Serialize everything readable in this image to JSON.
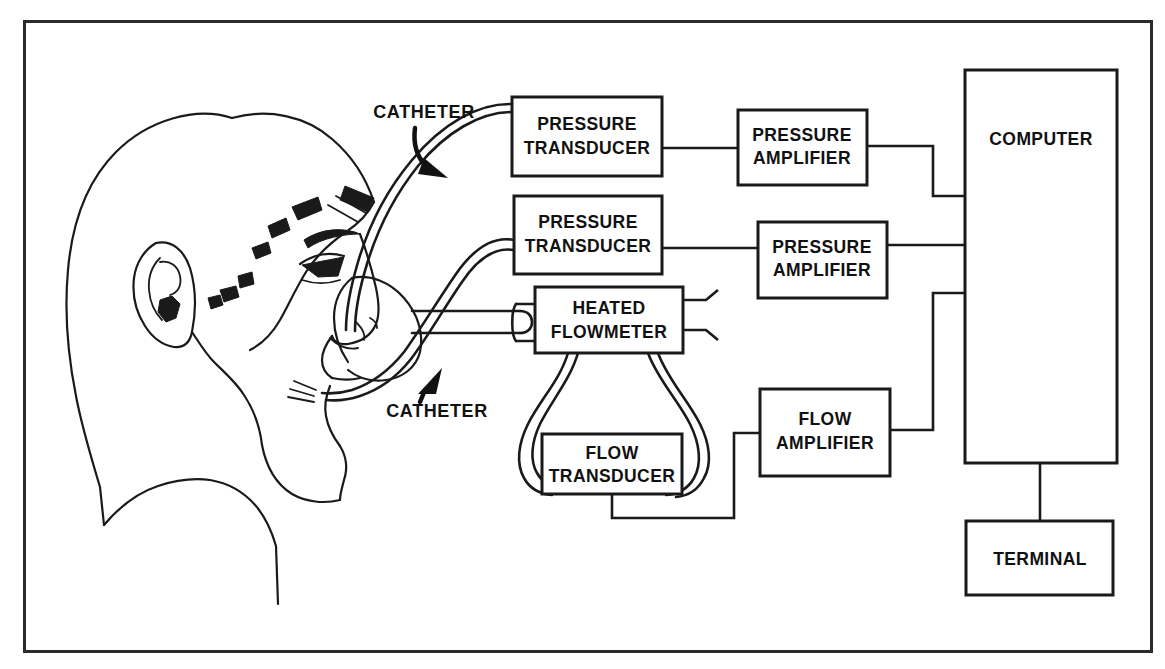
{
  "figure": {
    "background_color": "#ffffff",
    "line_color": "#1a1a1a",
    "frame_color": "#2b2b2b",
    "width": 1165,
    "height": 669
  },
  "subject": {
    "name": "patient-head-profile",
    "description": "Line drawing of a child's head in left profile wearing a nasal mask with mouthpiece tube"
  },
  "callouts": [
    {
      "id": "catheter-upper",
      "label": "CATHETER",
      "x": 424,
      "y": 118
    },
    {
      "id": "catheter-lower",
      "label": "CATHETER",
      "x": 437,
      "y": 417
    }
  ],
  "blocks": [
    {
      "id": "pressure-transducer-1",
      "line1": "PRESSURE",
      "line2": "TRANSDUCER",
      "x": 512,
      "y": 97,
      "w": 150,
      "h": 79
    },
    {
      "id": "pressure-transducer-2",
      "line1": "PRESSURE",
      "line2": "TRANSDUCER",
      "x": 514,
      "y": 196,
      "w": 148,
      "h": 78
    },
    {
      "id": "heated-flowmeter",
      "line1": "HEATED",
      "line2": "FLOWMETER",
      "x": 535,
      "y": 287,
      "w": 148,
      "h": 66
    },
    {
      "id": "flow-transducer",
      "line1": "FLOW",
      "line2": "TRANSDUCER",
      "x": 542,
      "y": 434,
      "w": 140,
      "h": 60
    },
    {
      "id": "pressure-amplifier-1",
      "line1": "PRESSURE",
      "line2": "AMPLIFIER",
      "x": 738,
      "y": 110,
      "w": 129,
      "h": 75
    },
    {
      "id": "pressure-amplifier-2",
      "line1": "PRESSURE",
      "line2": "AMPLIFIER",
      "x": 758,
      "y": 222,
      "w": 129,
      "h": 76
    },
    {
      "id": "flow-amplifier",
      "line1": "FLOW",
      "line2": "AMPLIFIER",
      "x": 760,
      "y": 389,
      "w": 130,
      "h": 87
    },
    {
      "id": "computer",
      "line1": "COMPUTER",
      "line2": "",
      "x": 965,
      "y": 70,
      "w": 152,
      "h": 393
    },
    {
      "id": "terminal",
      "line1": "TERMINAL",
      "line2": "",
      "x": 966,
      "y": 521,
      "w": 147,
      "h": 74
    }
  ],
  "connections": [
    {
      "id": "catheter-to-pressure-transducer-1",
      "from": "patient-nose",
      "to": "pressure-transducer-1",
      "kind": "catheter-tube"
    },
    {
      "id": "catheter-to-pressure-transducer-2",
      "from": "patient-mouth",
      "to": "pressure-transducer-2",
      "kind": "catheter-tube"
    },
    {
      "id": "pressure-transducer-1-to-pressure-amplifier-1",
      "from": "pressure-transducer-1",
      "to": "pressure-amplifier-1",
      "kind": "wire"
    },
    {
      "id": "pressure-transducer-2-to-pressure-amplifier-2",
      "from": "pressure-transducer-2",
      "to": "pressure-amplifier-2",
      "kind": "wire"
    },
    {
      "id": "pressure-amplifier-1-to-computer",
      "from": "pressure-amplifier-1",
      "to": "computer",
      "kind": "wire"
    },
    {
      "id": "pressure-amplifier-2-to-computer",
      "from": "pressure-amplifier-2",
      "to": "computer",
      "kind": "wire"
    },
    {
      "id": "mouthpiece-to-heated-flowmeter",
      "from": "patient-mouthpiece",
      "to": "heated-flowmeter",
      "kind": "airway-tube"
    },
    {
      "id": "heated-flowmeter-to-flow-transducer-left",
      "from": "heated-flowmeter",
      "to": "flow-transducer",
      "kind": "pressure-tube"
    },
    {
      "id": "heated-flowmeter-to-flow-transducer-right",
      "from": "heated-flowmeter",
      "to": "flow-transducer",
      "kind": "pressure-tube"
    },
    {
      "id": "flow-transducer-to-flow-amplifier",
      "from": "flow-transducer",
      "to": "flow-amplifier",
      "kind": "wire"
    },
    {
      "id": "flow-amplifier-to-computer",
      "from": "flow-amplifier",
      "to": "computer",
      "kind": "wire"
    },
    {
      "id": "computer-to-terminal",
      "from": "computer",
      "to": "terminal",
      "kind": "wire"
    }
  ]
}
